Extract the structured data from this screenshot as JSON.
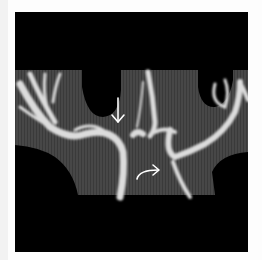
{
  "figure": {
    "type": "medical-image",
    "modality_appearance": "angiographic MIP of cerebral arteries",
    "background_color": "#000000",
    "tissue_color": "#4a4a4a",
    "vessel_color": "#e6e6e6"
  },
  "annotations": [
    {
      "id": "straight-arrow",
      "shape": "straight arrow pointing down",
      "color": "#ffffff",
      "x": 118,
      "y": 100
    },
    {
      "id": "curved-arrow",
      "shape": "curved arrow pointing right",
      "color": "#ffffff",
      "x": 147,
      "y": 161
    }
  ]
}
